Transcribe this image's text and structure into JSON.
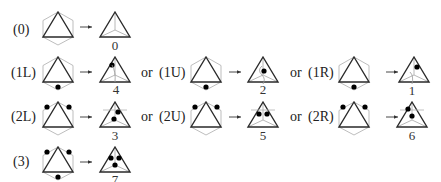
{
  "diagram": {
    "connector_word": "or",
    "colors": {
      "stroke": "#2a2a2a",
      "hexagon": "#b0b0b0",
      "inner": "#a8a8a8",
      "dot": "#000000"
    },
    "rows": [
      {
        "row": 0,
        "cases": [
          {
            "label": "(0)",
            "dots": [],
            "result": "0"
          }
        ]
      },
      {
        "row": 1,
        "cases": [
          {
            "label": "(1L)",
            "dots": [
              "bottom"
            ],
            "result": "4"
          },
          {
            "label": "(1U)",
            "dots": [
              "bottom"
            ],
            "result": "2"
          },
          {
            "label": "(1R)",
            "dots": [
              "bottom"
            ],
            "result": "1"
          }
        ]
      },
      {
        "row": 2,
        "cases": [
          {
            "label": "(2L)",
            "dots": [
              "left",
              "right"
            ],
            "result": "3"
          },
          {
            "label": "(2U)",
            "dots": [
              "left",
              "right"
            ],
            "result": "5"
          },
          {
            "label": "(2R)",
            "dots": [
              "left",
              "right"
            ],
            "result": "6"
          }
        ]
      },
      {
        "row": 3,
        "cases": [
          {
            "label": "(3)",
            "dots": [
              "left",
              "right",
              "bottom"
            ],
            "result": "7"
          }
        ]
      }
    ],
    "labels": {
      "r0c0": "(0)",
      "r0c0n": "0",
      "r1c0": "(1L)",
      "r1c0n": "4",
      "r1c1": "(1U)",
      "r1c1n": "2",
      "r1c2": "(1R)",
      "r1c2n": "1",
      "r2c0": "(2L)",
      "r2c0n": "3",
      "r2c1": "(2U)",
      "r2c1n": "5",
      "r2c2": "(2R)",
      "r2c2n": "6",
      "r3c0": "(3)",
      "r3c0n": "7"
    }
  }
}
